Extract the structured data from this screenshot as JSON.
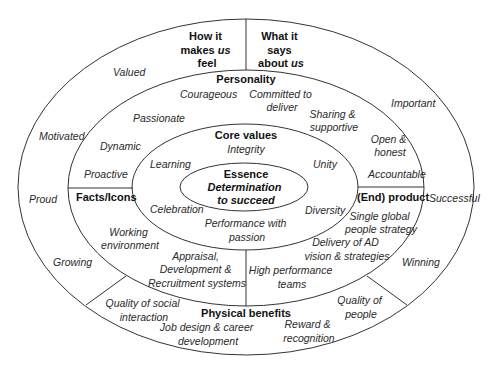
{
  "diagram": {
    "outer_ring": {
      "header_left": [
        "How it",
        "makes us",
        "feel"
      ],
      "header_right": [
        "What it",
        "says",
        "about us"
      ],
      "left_items": [
        "Valued",
        "Motivated",
        "Proud",
        "Growing"
      ],
      "right_items": [
        "Important",
        "Successful",
        "Winning"
      ],
      "bottom_left": [
        "Quality of social",
        "interaction"
      ],
      "bottom_right": [
        "Quality of",
        "people"
      ]
    },
    "personality": {
      "title": "Personality",
      "items": {
        "courageous": "Courageous",
        "committed": [
          "Committed to",
          "deliver"
        ],
        "passionate": "Passionate",
        "sharing": [
          "Sharing &",
          "supportive"
        ],
        "dynamic": "Dynamic",
        "open": [
          "Open &",
          "honest"
        ],
        "proactive": "Proactive",
        "accountable": "Accountable"
      }
    },
    "facts_icons": {
      "title": "Facts/Icons",
      "items": {
        "working": [
          "Working",
          "environment"
        ],
        "appraisal": [
          "Appraisal,",
          "Development &",
          "Recruitment systems"
        ]
      }
    },
    "end_product": {
      "title": "(End) product",
      "items": {
        "single": [
          "Single global",
          "people strategy"
        ],
        "delivery": [
          "Delivery of AD",
          "vision & strategies"
        ],
        "high": [
          "High performance",
          "teams"
        ]
      }
    },
    "physical_benefits": {
      "title": "Physical benefits",
      "items": {
        "job": [
          "Job design & career",
          "development"
        ],
        "reward": [
          "Reward &",
          "recognition"
        ]
      }
    },
    "core_values": {
      "title": "Core values",
      "items": {
        "integrity": "Integrity",
        "learning": "Learning",
        "unity": "Unity",
        "celebration": "Celebration",
        "diversity": "Diversity",
        "performance": [
          "Performance with",
          "passion"
        ]
      }
    },
    "essence": {
      "title": "Essence",
      "statement": [
        "Determination",
        "to succeed"
      ]
    }
  }
}
